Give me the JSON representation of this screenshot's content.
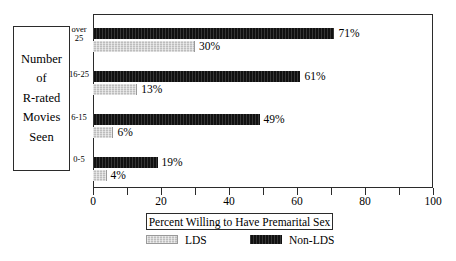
{
  "chart_data": {
    "type": "bar",
    "orientation": "horizontal",
    "title": "",
    "xlabel": "Percent Willing to Have Premarital Sex",
    "ylabel": "Number of R-rated Movies Seen",
    "categories": [
      "over 25",
      "16-25",
      "6-15",
      "0-5"
    ],
    "series": [
      {
        "name": "Non-LDS",
        "color": "#111111",
        "values": [
          71,
          61,
          49,
          19
        ],
        "value_labels": [
          "71%",
          "61%",
          "49%",
          "19%"
        ]
      },
      {
        "name": "LDS",
        "color": "#bdbdbd",
        "values": [
          30,
          13,
          6,
          4
        ],
        "value_labels": [
          "30%",
          "13%",
          "6%",
          "4%"
        ]
      }
    ],
    "xlim": [
      0,
      100
    ],
    "x_major_ticks": [
      0,
      20,
      40,
      60,
      80,
      100
    ],
    "x_minor_ticks": [
      10,
      30,
      50,
      70,
      90
    ],
    "x_tick_labels": [
      "0",
      "20",
      "40",
      "60",
      "80",
      "100"
    ],
    "grid": false,
    "legend_position": "bottom"
  },
  "y_axis_title": {
    "lines": [
      "Number",
      "of",
      "R-rated",
      "Movies",
      "Seen"
    ]
  },
  "category_labels": [
    {
      "line1": "over",
      "line2": "25"
    },
    {
      "line1": "16-25",
      "line2": ""
    },
    {
      "line1": "6-15",
      "line2": ""
    },
    {
      "line1": "0-5",
      "line2": ""
    }
  ],
  "bars": [
    {
      "group": "over 25",
      "series": "Non-LDS",
      "value": 71,
      "label": "71%"
    },
    {
      "group": "over 25",
      "series": "LDS",
      "value": 30,
      "label": "30%"
    },
    {
      "group": "16-25",
      "series": "Non-LDS",
      "value": 61,
      "label": "61%"
    },
    {
      "group": "16-25",
      "series": "LDS",
      "value": 13,
      "label": "13%"
    },
    {
      "group": "6-15",
      "series": "Non-LDS",
      "value": 49,
      "label": "49%"
    },
    {
      "group": "6-15",
      "series": "LDS",
      "value": 6,
      "label": "6%"
    },
    {
      "group": "0-5",
      "series": "Non-LDS",
      "value": 19,
      "label": "19%"
    },
    {
      "group": "0-5",
      "series": "LDS",
      "value": 4,
      "label": "4%"
    }
  ],
  "x_labels": [
    "0",
    "20",
    "40",
    "60",
    "80",
    "100"
  ],
  "legend": {
    "title": "Percent Willing to Have Premarital Sex",
    "entries": [
      {
        "label": "LDS",
        "color": "#bdbdbd"
      },
      {
        "label": "Non-LDS",
        "color": "#111111"
      }
    ]
  }
}
